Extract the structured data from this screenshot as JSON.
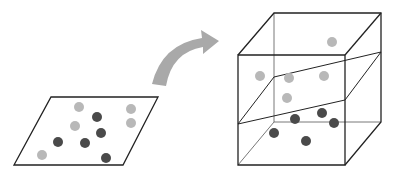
{
  "colors": {
    "line": "#222222",
    "thin_line": "#555555",
    "light_point": "#b8b8b8",
    "dark_point": "#4a4a4a",
    "arrow": "#a9a9a9",
    "background": "#ffffff"
  },
  "input_plane": {
    "polygon": [
      [
        51,
        97
      ],
      [
        158,
        97
      ],
      [
        123,
        165
      ],
      [
        14,
        165
      ]
    ],
    "light_points": [
      [
        79,
        107
      ],
      [
        131,
        109
      ],
      [
        131,
        123
      ],
      [
        75,
        126
      ],
      [
        42,
        155
      ]
    ],
    "dark_points": [
      [
        97,
        117
      ],
      [
        101,
        133
      ],
      [
        58,
        142
      ],
      [
        85,
        143
      ],
      [
        106,
        158
      ]
    ]
  },
  "arrow": {
    "path": "M 157 87 Q 170 45 214 42"
  },
  "feature_space": {
    "front_face": [
      [
        238,
        55
      ],
      [
        345,
        55
      ],
      [
        345,
        165
      ],
      [
        238,
        165
      ]
    ],
    "back_face": [
      [
        274,
        13
      ],
      [
        381,
        13
      ],
      [
        381,
        122
      ],
      [
        274,
        122
      ]
    ],
    "separating_plane": [
      [
        238,
        124
      ],
      [
        345,
        100
      ],
      [
        381,
        52
      ],
      [
        274,
        77
      ]
    ],
    "light_points": [
      [
        332,
        42
      ],
      [
        260,
        76
      ],
      [
        289,
        78
      ],
      [
        324,
        76
      ],
      [
        287,
        98
      ]
    ],
    "dark_points": [
      [
        295,
        119
      ],
      [
        322,
        113
      ],
      [
        334,
        123
      ],
      [
        274,
        133
      ],
      [
        306,
        141
      ]
    ]
  }
}
